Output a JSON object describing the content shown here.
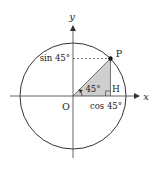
{
  "diagram": {
    "angle_degrees": 45,
    "labels": {
      "x_axis": "x",
      "y_axis": "y",
      "origin": "O",
      "point_p": "P",
      "point_h": "H",
      "angle": "45°",
      "sin_label": "sin 45°",
      "cos_label": "cos 45°"
    },
    "colors": {
      "stroke": "#222222",
      "triangle_fill": "#cfcfcf",
      "dashed": "#555555"
    }
  }
}
